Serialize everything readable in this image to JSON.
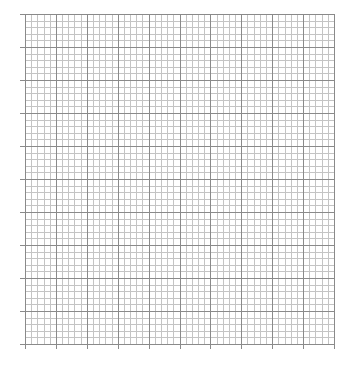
{
  "graph_paper": {
    "left": 25,
    "top": 14,
    "width": 309,
    "height": 330,
    "major_cols": 10,
    "major_rows": 10,
    "minor_per_major": 5,
    "tick_length": 5,
    "colors": {
      "minor": "#c4c4c4",
      "major": "#8a8a8a",
      "background": "#ffffff"
    }
  }
}
